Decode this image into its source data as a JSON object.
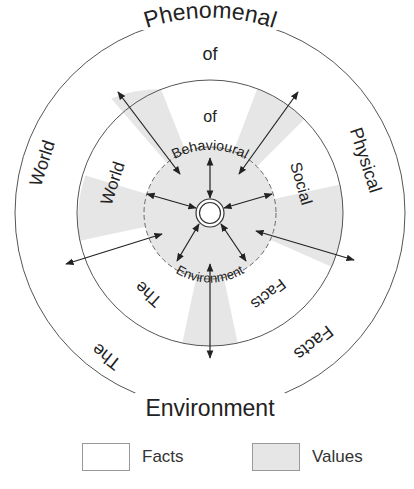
{
  "diagram": {
    "type": "concentric-circles",
    "colors": {
      "values_fill": "#e6e6e6",
      "facts_fill": "#ffffff",
      "line": "#333333"
    },
    "outer_ring": {
      "top": "Phenomenal",
      "top_sub": "of",
      "left": "World",
      "right": "Physical",
      "bottom_left": "The",
      "bottom_right": "Facts",
      "bottom": "Environment"
    },
    "middle_ring": {
      "top": "of",
      "left": "World",
      "right": "Social",
      "bottom_left": "The",
      "bottom_right": "Facts"
    },
    "inner_circle": {
      "top": "Behavioural",
      "bottom": "Environment"
    }
  },
  "legend": {
    "items": [
      {
        "label": "Facts",
        "fill": "#ffffff"
      },
      {
        "label": "Values",
        "fill": "#e6e6e6"
      }
    ]
  }
}
